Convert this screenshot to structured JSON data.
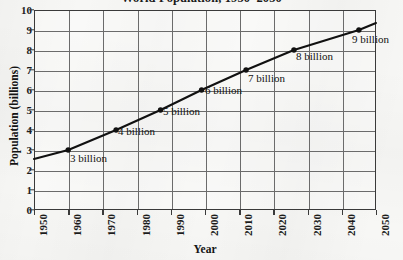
{
  "chart_data": {
    "type": "line",
    "title": "World Population, 1950–2050",
    "xlabel": "Year",
    "ylabel": "Population (billions)",
    "xlim": [
      1950,
      2050
    ],
    "ylim": [
      0,
      10
    ],
    "grid": true,
    "legend": "none",
    "xticks": [
      "1950",
      "1960",
      "1970",
      "1980",
      "1990",
      "2000",
      "2010",
      "2020",
      "2030",
      "2040",
      "2050"
    ],
    "yticks": [
      "0",
      "1",
      "2",
      "3",
      "4",
      "5",
      "6",
      "7",
      "8",
      "9",
      "10"
    ],
    "line_color": "#111111",
    "marker_color": "#111111",
    "grid_color": "#6b6b6b",
    "x": [
      1950,
      1960,
      1974,
      1987,
      1999,
      2012,
      2026,
      2045,
      2050
    ],
    "values": [
      2.55,
      3.0,
      4.0,
      5.0,
      6.0,
      7.0,
      8.0,
      9.0,
      9.35
    ],
    "series": [
      {
        "name": "World population",
        "values": [
          2.55,
          3.0,
          4.0,
          5.0,
          6.0,
          7.0,
          8.0,
          9.0,
          9.35
        ]
      }
    ],
    "markers": [
      {
        "year": 1960,
        "value": 3.0,
        "label": "3 billion"
      },
      {
        "year": 1974,
        "value": 4.0,
        "label": "4 billion"
      },
      {
        "year": 1987,
        "value": 5.0,
        "label": "5 billion"
      },
      {
        "year": 1999,
        "value": 6.0,
        "label": "6 billion"
      },
      {
        "year": 2012,
        "value": 7.0,
        "label": "7 billion"
      },
      {
        "year": 2026,
        "value": 8.0,
        "label": "8 billion"
      },
      {
        "year": 2045,
        "value": 9.0,
        "label": "9 billion"
      }
    ],
    "annotations": [
      {
        "text": "3 billion",
        "x": 70,
        "y": 153
      },
      {
        "text": "4 billion",
        "x": 118,
        "y": 126
      },
      {
        "text": "5 billion",
        "x": 163,
        "y": 106
      },
      {
        "text": "6 billion",
        "x": 205,
        "y": 85
      },
      {
        "text": "7 billion",
        "x": 248,
        "y": 73
      },
      {
        "text": "8 billion",
        "x": 296,
        "y": 51
      },
      {
        "text": "9 billion",
        "x": 352,
        "y": 34
      }
    ]
  }
}
